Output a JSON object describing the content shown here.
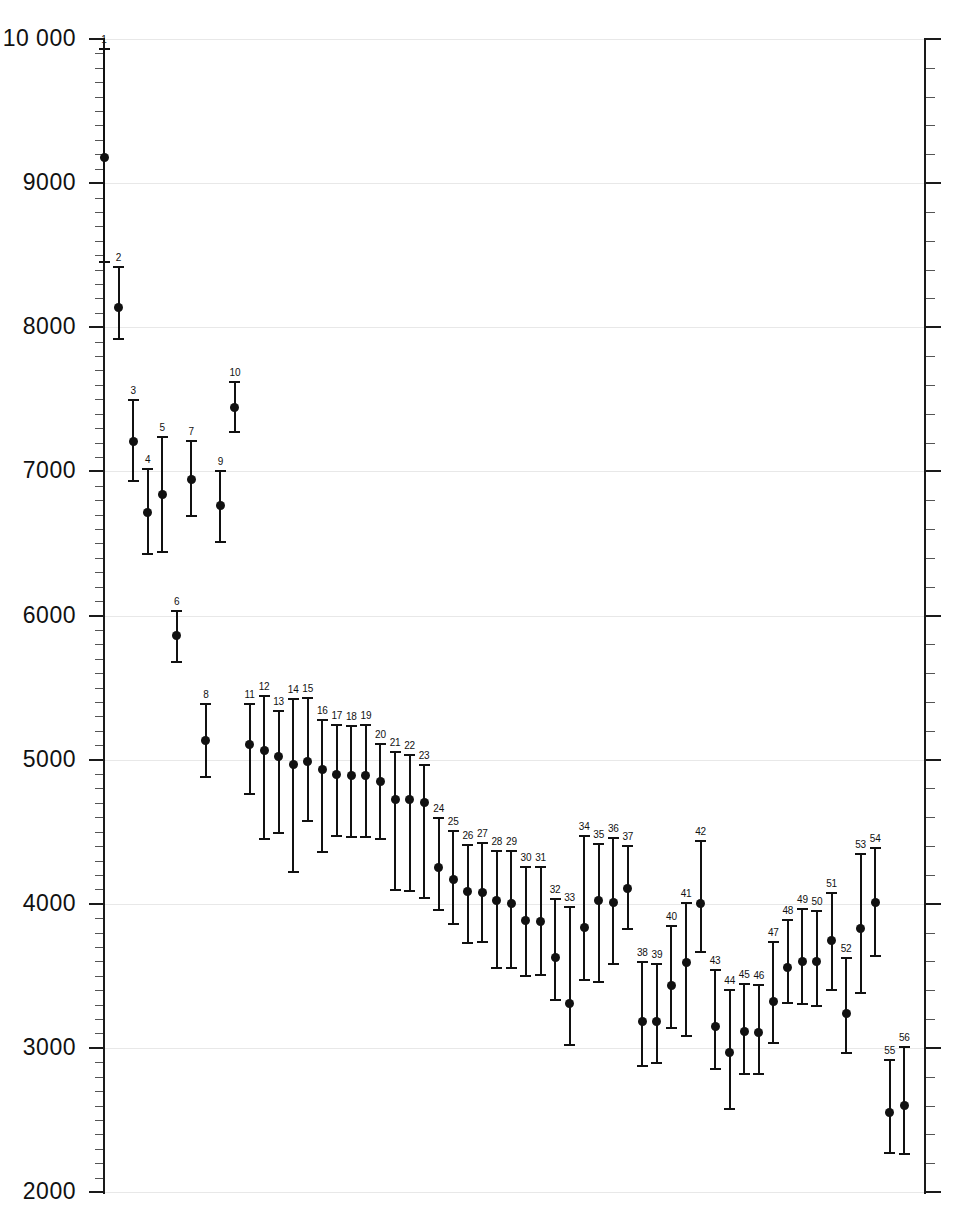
{
  "chart_data": {
    "type": "scatter",
    "title": "",
    "subtitle": "",
    "xlabel": "",
    "ylabel": "",
    "ylim": [
      2000,
      10000
    ],
    "y_major_step": 1000,
    "y_minor_step": 100,
    "y_tick_labels": [
      "10 000",
      "9000",
      "8000",
      "7000",
      "6000",
      "5000",
      "4000",
      "3000",
      "2000"
    ],
    "y_tick_values": [
      10000,
      9000,
      8000,
      7000,
      6000,
      5000,
      4000,
      3000,
      2000
    ],
    "grid": true,
    "grid_axis": "y",
    "legend": "none",
    "x_axis_visible": false,
    "point_labels_position": "above-upper-cap",
    "marker": "filled-circle",
    "error_bar_style": "capped-vertical",
    "series": [
      {
        "name": "estimates",
        "labels": [
          "1",
          "2",
          "3",
          "4",
          "5",
          "6",
          "7",
          "8",
          "9",
          "10",
          "11",
          "12",
          "13",
          "14",
          "15",
          "16",
          "17",
          "18",
          "19",
          "20",
          "21",
          "22",
          "23",
          "24",
          "25",
          "26",
          "27",
          "28",
          "29",
          "30",
          "31",
          "32",
          "33",
          "34",
          "35",
          "36",
          "37",
          "38",
          "39",
          "40",
          "41",
          "42",
          "43",
          "44",
          "45",
          "46",
          "47",
          "48",
          "49",
          "50",
          "51",
          "52",
          "53",
          "54",
          "55",
          "56"
        ],
        "x": [
          1,
          2,
          3,
          4,
          5,
          6,
          7,
          8,
          9,
          10,
          11,
          12,
          13,
          14,
          15,
          16,
          17,
          18,
          19,
          20,
          21,
          22,
          23,
          24,
          25,
          26,
          27,
          28,
          29,
          30,
          31,
          32,
          33,
          34,
          35,
          36,
          37,
          38,
          39,
          40,
          41,
          42,
          43,
          44,
          45,
          46,
          47,
          48,
          49,
          50,
          51,
          52,
          53,
          54,
          55,
          56
        ],
        "values": [
          9180,
          8140,
          7205,
          6715,
          6840,
          5860,
          6945,
          5130,
          6760,
          7445,
          5105,
          5065,
          5025,
          4965,
          4990,
          4930,
          4895,
          4890,
          4890,
          4850,
          4725,
          4720,
          4700,
          4250,
          4165,
          4085,
          4075,
          4020,
          4000,
          3885,
          3875,
          3625,
          3310,
          3835,
          4025,
          4010,
          4105,
          3185,
          3185,
          3430,
          3595,
          4000,
          3150,
          2970,
          3115,
          3110,
          3325,
          3560,
          3600,
          3600,
          3745,
          3240,
          3825,
          4010,
          2550,
          2600
        ],
        "lower": [
          8443,
          7915,
          6925,
          6420,
          6435,
          5670,
          6680,
          4875,
          6505,
          7265,
          4755,
          4445,
          4485,
          4215,
          4565,
          4350,
          4460,
          4455,
          4455,
          4445,
          4090,
          4080,
          4035,
          3950,
          3855,
          3720,
          3730,
          3545,
          3545,
          3490,
          3500,
          3325,
          3010,
          3465,
          3450,
          3575,
          3820,
          2870,
          2890,
          3130,
          3075,
          3660,
          2845,
          2570,
          2810,
          2815,
          3030,
          3305,
          3300,
          3285,
          3395,
          2960,
          3375,
          3630,
          2265,
          2255
        ],
        "upper": [
          9940,
          8425,
          7505,
          7020,
          7245,
          6035,
          7220,
          5395,
          7010,
          7625,
          5395,
          5450,
          5345,
          5430,
          5435,
          5280,
          5245,
          5240,
          5250,
          5115,
          5060,
          5040,
          4970,
          4600,
          4510,
          4415,
          4430,
          4370,
          4370,
          4260,
          4265,
          4040,
          3985,
          4475,
          4420,
          4465,
          4410,
          3600,
          3590,
          3850,
          4010,
          4440,
          3550,
          3410,
          3450,
          3440,
          3740,
          3895,
          3970,
          3960,
          4080,
          3630,
          4355,
          4395,
          2920,
          3010
        ]
      }
    ]
  },
  "axis": {
    "y_left_name": "left-value-axis",
    "y_right_name": "right-value-axis"
  },
  "colors": {
    "marker": "#111111",
    "whisker": "#111111",
    "grid": "#e8e8e8",
    "axis": "#1a1a1a",
    "background": "#ffffff"
  }
}
